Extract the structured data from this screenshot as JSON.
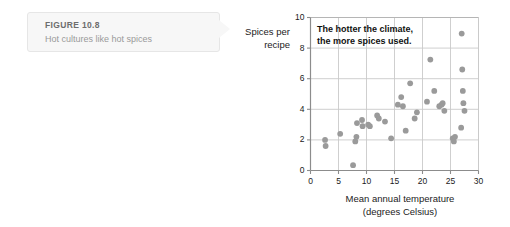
{
  "caption": {
    "figure_number": "FIGURE 10.8",
    "title": "Hot cultures like hot spices"
  },
  "chart_data": {
    "type": "scatter",
    "title": "",
    "annotation": "The hotter the climate,\nthe more spices used.",
    "xlabel": "Mean annual temperature\n(degrees Celsius)",
    "xlabel_line1": "Mean annual temperature",
    "xlabel_line2": "(degrees Celsius)",
    "ylabel": "Spices per\nrecipe",
    "ylabel_line1": "Spices per",
    "ylabel_line2": "recipe",
    "xlim": [
      0,
      30
    ],
    "ylim": [
      0,
      10
    ],
    "xticks": [
      0,
      5,
      10,
      15,
      20,
      25,
      30
    ],
    "yticks": [
      0,
      2,
      4,
      6,
      8,
      10
    ],
    "grid": true,
    "legend": "none",
    "marker_color": "#9a9a9a",
    "points": [
      {
        "x": 2.6,
        "y": 2.0
      },
      {
        "x": 2.7,
        "y": 1.6
      },
      {
        "x": 5.3,
        "y": 2.4
      },
      {
        "x": 7.6,
        "y": 0.35
      },
      {
        "x": 8.0,
        "y": 1.9
      },
      {
        "x": 8.2,
        "y": 2.2
      },
      {
        "x": 8.3,
        "y": 3.1
      },
      {
        "x": 9.2,
        "y": 3.3
      },
      {
        "x": 9.3,
        "y": 2.9
      },
      {
        "x": 10.3,
        "y": 3.0
      },
      {
        "x": 10.6,
        "y": 2.9
      },
      {
        "x": 11.9,
        "y": 3.6
      },
      {
        "x": 12.2,
        "y": 3.4
      },
      {
        "x": 13.3,
        "y": 3.2
      },
      {
        "x": 14.4,
        "y": 2.1
      },
      {
        "x": 15.6,
        "y": 4.3
      },
      {
        "x": 16.2,
        "y": 4.8
      },
      {
        "x": 16.5,
        "y": 4.2
      },
      {
        "x": 17.0,
        "y": 2.6
      },
      {
        "x": 17.8,
        "y": 5.7
      },
      {
        "x": 18.6,
        "y": 3.4
      },
      {
        "x": 19.0,
        "y": 3.8
      },
      {
        "x": 20.8,
        "y": 4.5
      },
      {
        "x": 21.4,
        "y": 7.25
      },
      {
        "x": 22.1,
        "y": 5.2
      },
      {
        "x": 23.0,
        "y": 4.2
      },
      {
        "x": 23.4,
        "y": 4.3
      },
      {
        "x": 23.6,
        "y": 4.4
      },
      {
        "x": 23.9,
        "y": 3.9
      },
      {
        "x": 25.4,
        "y": 2.1
      },
      {
        "x": 25.6,
        "y": 1.9
      },
      {
        "x": 25.8,
        "y": 2.2
      },
      {
        "x": 26.9,
        "y": 2.8
      },
      {
        "x": 27.0,
        "y": 8.95
      },
      {
        "x": 27.1,
        "y": 6.6
      },
      {
        "x": 27.2,
        "y": 5.2
      },
      {
        "x": 27.3,
        "y": 4.4
      },
      {
        "x": 27.5,
        "y": 3.9
      }
    ]
  }
}
